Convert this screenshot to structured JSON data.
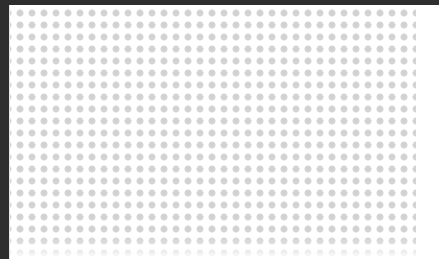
{
  "window": {
    "title": "",
    "width": 439,
    "height": 259
  },
  "chrome": {
    "top_band_label": "",
    "top_band_color": "#2e2e2e",
    "top_band_height": 5,
    "left_rail_label": "",
    "left_rail_color": "#2e2e2e",
    "left_rail_width": 9,
    "seam_color": "#e8e8e8"
  },
  "canvas": {
    "label": "",
    "background_color": "#ffffff",
    "x": 10,
    "y": 5,
    "width": 429,
    "height": 254
  },
  "dot_grid": {
    "label": "",
    "dot_color": "#d2d2d2",
    "dot_edge_color": "#dcdcdc",
    "dot_diameter": 6,
    "cell_pitch": 12,
    "origin_x": 4,
    "origin_y": 2,
    "field_width": 406,
    "field_height": 254,
    "columns": 34,
    "rows": 21,
    "fade_edge": "bottom"
  },
  "gutter": {
    "label": "",
    "color": "#ffffff",
    "width": 23
  }
}
